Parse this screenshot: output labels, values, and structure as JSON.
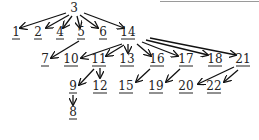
{
  "diagram": {
    "type": "tree",
    "colors": {
      "ink": "#111111",
      "background": "#ffffff"
    },
    "nodes": [
      {
        "id": "3",
        "x": 74,
        "y": 12,
        "underlined": false
      },
      {
        "id": "1",
        "x": 16,
        "y": 36,
        "underlined": true
      },
      {
        "id": "2",
        "x": 38,
        "y": 36,
        "underlined": true
      },
      {
        "id": "4",
        "x": 60,
        "y": 36,
        "underlined": true
      },
      {
        "id": "5",
        "x": 81,
        "y": 36,
        "underlined": true
      },
      {
        "id": "6",
        "x": 103,
        "y": 36,
        "underlined": true
      },
      {
        "id": "14",
        "x": 128,
        "y": 36,
        "underlined": true
      },
      {
        "id": "7",
        "x": 45,
        "y": 63,
        "underlined": true
      },
      {
        "id": "10",
        "x": 71,
        "y": 63,
        "underlined": true
      },
      {
        "id": "11",
        "x": 99,
        "y": 63,
        "underlined": true
      },
      {
        "id": "13",
        "x": 127,
        "y": 63,
        "underlined": true
      },
      {
        "id": "16",
        "x": 157,
        "y": 63,
        "underlined": true
      },
      {
        "id": "17",
        "x": 186,
        "y": 63,
        "underlined": true
      },
      {
        "id": "18",
        "x": 215,
        "y": 63,
        "underlined": true
      },
      {
        "id": "21",
        "x": 243,
        "y": 63,
        "underlined": true
      },
      {
        "id": "9",
        "x": 73,
        "y": 90,
        "underlined": true
      },
      {
        "id": "12",
        "x": 100,
        "y": 90,
        "underlined": true
      },
      {
        "id": "15",
        "x": 126,
        "y": 90,
        "underlined": true
      },
      {
        "id": "19",
        "x": 156,
        "y": 90,
        "underlined": true
      },
      {
        "id": "20",
        "x": 186,
        "y": 90,
        "underlined": true
      },
      {
        "id": "22",
        "x": 214,
        "y": 90,
        "underlined": true
      },
      {
        "id": "8",
        "x": 73,
        "y": 116,
        "underlined": true
      }
    ],
    "edges": [
      {
        "from": "3",
        "to": "1",
        "path": [
          [
            66,
            13
          ],
          [
            20,
            28
          ]
        ]
      },
      {
        "from": "3",
        "to": "2",
        "path": [
          [
            69,
            15
          ],
          [
            46,
            28
          ]
        ]
      },
      {
        "from": "3",
        "to": "4",
        "path": [
          [
            72,
            16
          ],
          [
            63,
            28
          ]
        ]
      },
      {
        "from": "3",
        "to": "5",
        "path": [
          [
            77,
            16
          ],
          [
            80,
            28
          ]
        ]
      },
      {
        "from": "3",
        "to": "6",
        "path": [
          [
            80,
            15
          ],
          [
            98,
            28
          ]
        ]
      },
      {
        "from": "3",
        "to": "14",
        "path": [
          [
            84,
            13
          ],
          [
            124,
            28
          ]
        ]
      },
      {
        "from": "5",
        "to": "7",
        "path": [
          [
            79,
            41
          ],
          [
            51,
            58
          ]
        ]
      },
      {
        "from": "14",
        "to": "10",
        "path": [
          [
            122,
            44
          ],
          [
            81,
            58
          ]
        ]
      },
      {
        "from": "14",
        "to": "11",
        "path": [
          [
            124,
            45
          ],
          [
            106,
            56
          ]
        ]
      },
      {
        "from": "14",
        "to": "13",
        "path": [
          [
            128,
            44
          ],
          [
            128,
            53
          ]
        ]
      },
      {
        "from": "14",
        "to": "16",
        "path": [
          [
            137,
            44
          ],
          [
            151,
            56
          ]
        ]
      },
      {
        "from": "14",
        "to": "17",
        "path": [
          [
            142,
            42
          ],
          [
            178,
            56
          ]
        ]
      },
      {
        "from": "14",
        "to": "18",
        "path": [
          [
            146,
            40
          ],
          [
            208,
            55
          ]
        ]
      },
      {
        "from": "14",
        "to": "21",
        "path": [
          [
            150,
            38
          ],
          [
            236,
            55
          ]
        ]
      },
      {
        "from": "11",
        "to": "9",
        "path": [
          [
            94,
            69
          ],
          [
            79,
            85
          ]
        ]
      },
      {
        "from": "11",
        "to": "12",
        "path": [
          [
            100,
            68
          ],
          [
            100,
            78
          ]
        ]
      },
      {
        "from": "9",
        "to": "8",
        "path": [
          [
            73,
            95
          ],
          [
            73,
            105
          ]
        ]
      },
      {
        "from": "16",
        "to": "15",
        "path": [
          [
            150,
            69
          ],
          [
            136,
            82
          ]
        ]
      },
      {
        "from": "17",
        "to": "19",
        "path": [
          [
            180,
            69
          ],
          [
            166,
            82
          ]
        ]
      },
      {
        "from": "21",
        "to": "20",
        "path": [
          [
            234,
            67
          ],
          [
            198,
            84
          ]
        ]
      },
      {
        "from": "21",
        "to": "22",
        "path": [
          [
            238,
            70
          ],
          [
            224,
            82
          ]
        ]
      }
    ]
  }
}
